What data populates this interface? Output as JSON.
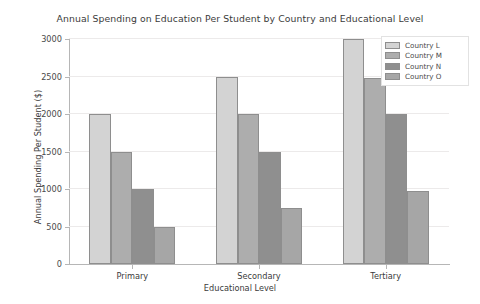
{
  "chart_data": {
    "type": "bar",
    "title": "Annual Spending on Education Per Student by Country and Educational Level",
    "xlabel": "Educational Level",
    "ylabel": "Annual Spending Per Student ($)",
    "categories": [
      "Primary",
      "Secondary",
      "Tertiary"
    ],
    "series": [
      {
        "name": "Country L",
        "values": [
          2000,
          2500,
          3000
        ],
        "color": "#d3d3d3"
      },
      {
        "name": "Country M",
        "values": [
          1500,
          2000,
          2480
        ],
        "color": "#adadad"
      },
      {
        "name": "Country N",
        "values": [
          1000,
          1500,
          2000
        ],
        "color": "#8f8f8f"
      },
      {
        "name": "Country O",
        "values": [
          500,
          750,
          980
        ],
        "color": "#a6a6a6"
      }
    ],
    "ylim": [
      0,
      3000
    ],
    "yticks": [
      0,
      500,
      1000,
      1500,
      2000,
      2500,
      3000
    ],
    "ytick_labels": [
      "0",
      "500",
      "1000",
      "1500",
      "2000",
      "2500",
      "3000"
    ],
    "grid": true,
    "legend_position": "upper right",
    "bar_edge_color": "#8e8e8e",
    "background_color": "#ffffff"
  }
}
